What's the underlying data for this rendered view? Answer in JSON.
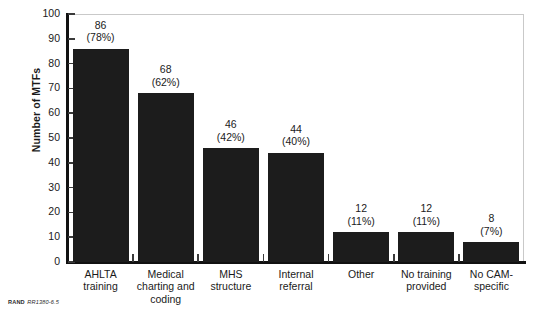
{
  "chart_data": {
    "type": "bar",
    "title": "",
    "subtitle": "",
    "xlabel": "",
    "ylabel": "Number of MTFs",
    "ylim": [
      0,
      100
    ],
    "ytick_step": 10,
    "yticks": [
      0,
      10,
      20,
      30,
      40,
      50,
      60,
      70,
      80,
      90,
      100
    ],
    "grid": false,
    "legend": null,
    "legend_position": "none",
    "bar_color": "#1c1c1c",
    "frame_color": "#c9c9c9",
    "axis_color": "#111111",
    "categories": [
      "AHLTA training",
      "Medical charting and coding",
      "MHS structure",
      "Internal referral",
      "Other",
      "No training provided",
      "No CAM-specific"
    ],
    "category_lines": [
      [
        "AHLTA",
        "training"
      ],
      [
        "Medical",
        "charting and",
        "coding"
      ],
      [
        "MHS",
        "structure"
      ],
      [
        "Internal",
        "referral"
      ],
      [
        "Other"
      ],
      [
        "No training",
        "provided"
      ],
      [
        "No CAM-",
        "specific"
      ]
    ],
    "values": [
      86,
      68,
      46,
      44,
      12,
      12,
      8
    ],
    "percents": [
      "(78%)",
      "(62%)",
      "(42%)",
      "(40%)",
      "(11%)",
      "(11%)",
      "(7%)"
    ],
    "percent_values": [
      78,
      62,
      42,
      40,
      11,
      11,
      7
    ],
    "data_labels": [
      {
        "value": "86",
        "percent": "(78%)"
      },
      {
        "value": "68",
        "percent": "(62%)"
      },
      {
        "value": "46",
        "percent": "(42%)"
      },
      {
        "value": "44",
        "percent": "(40%)"
      },
      {
        "value": "12",
        "percent": "(11%)"
      },
      {
        "value": "12",
        "percent": "(11%)"
      },
      {
        "value": "8",
        "percent": "(7%)"
      }
    ]
  },
  "ytick_labels": [
    "100",
    "90",
    "80",
    "70",
    "60",
    "50",
    "40",
    "30",
    "20",
    "10",
    "0"
  ],
  "source_note": {
    "organization": "RAND",
    "figure_id": "RR1380-6.5"
  }
}
